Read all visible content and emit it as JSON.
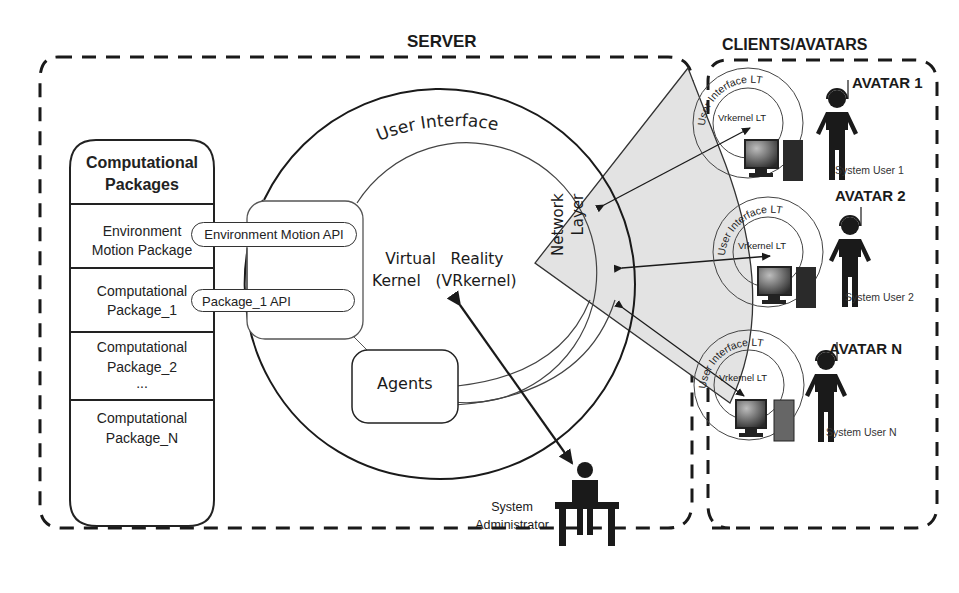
{
  "server": {
    "title": "SERVER",
    "packages": {
      "header": [
        "Computational",
        "Packages"
      ],
      "items": [
        {
          "line1": "Environment",
          "line2": "Motion Package"
        },
        {
          "line1": "Computational",
          "line2": "Package_1"
        },
        {
          "line1": "Computational",
          "line2": "Package_2",
          "line3": "..."
        },
        {
          "line1": "Computational",
          "line2": "Package_N"
        }
      ]
    },
    "apis": [
      "Environment Motion API",
      "Package_1 API"
    ],
    "user_interface": "User Interface",
    "kernel": {
      "line1": "Virtual   Reality",
      "line2": "Kernel   (VRkernel)"
    },
    "agents": "Agents",
    "network_layer": {
      "line1": "Network",
      "line2": "Layer"
    },
    "administrator": {
      "line1": "System",
      "line2": "Administrator"
    }
  },
  "clients": {
    "title": "CLIENTS/AVATARS",
    "avatars": [
      {
        "name": "AVATAR 1",
        "user": "System User 1",
        "ui": "User Interface LT",
        "kernel": "Vrkernel LT"
      },
      {
        "name": "AVATAR 2",
        "user": "System User 2",
        "ui": "User Interface LT",
        "kernel": "Vrkernel LT"
      },
      {
        "name": "AVATAR N",
        "user": "System User N",
        "ui": "User Interface LT",
        "kernel": "Vrkernel LT"
      }
    ]
  },
  "colors": {
    "line": "#1a1a1a",
    "network_fill": "#e3e3e3",
    "background": "#ffffff"
  }
}
